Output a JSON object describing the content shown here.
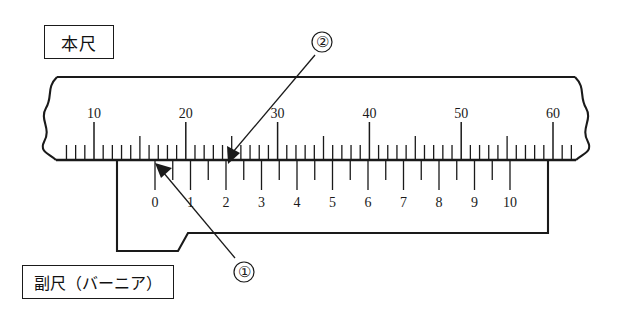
{
  "figure": {
    "type": "vernier-caliper-scale-diagram"
  },
  "labels": {
    "main_scale": "本尺",
    "vernier_scale": "副尺（バーニア）"
  },
  "callouts": [
    {
      "id": "callout-1",
      "text": "①",
      "points_to": "vernier-zero-mark"
    },
    {
      "id": "callout-2",
      "text": "②",
      "points_to": "main-scale-reading-mark"
    }
  ],
  "main_scale": {
    "name": "main-scale",
    "tick_labels": [
      "10",
      "20",
      "30",
      "40",
      "50",
      "60"
    ],
    "label_values": [
      10,
      20,
      30,
      40,
      50,
      60
    ],
    "unit_min": 3,
    "unit_max": 64,
    "tick_unit_step": 1,
    "medium_tick_every": 5,
    "long_tick_every": 10
  },
  "vernier_scale": {
    "name": "vernier-scale",
    "tick_labels": [
      "0",
      "1",
      "2",
      "3",
      "4",
      "5",
      "6",
      "7",
      "8",
      "9",
      "10"
    ],
    "label_values": [
      0,
      1,
      2,
      3,
      4,
      5,
      6,
      7,
      8,
      9,
      10
    ],
    "divisions": 20,
    "labeled_every": 2
  },
  "colors": {
    "line": "#1a1a1a",
    "background": "#ffffff"
  }
}
